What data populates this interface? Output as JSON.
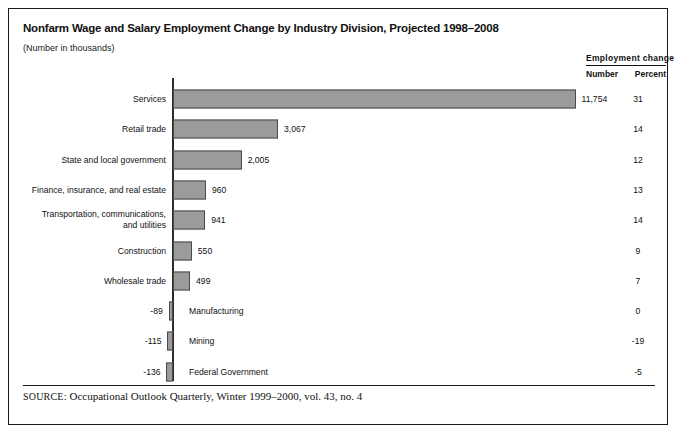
{
  "figure": {
    "title": "Nonfarm Wage and Salary Employment Change by Industry Division, Projected 1998–2008",
    "subtitle": "(Number in thousands)",
    "source_prefix": "SOURCE",
    "source_text": ": Occupational Outlook Quarterly, Winter 1999–2000, vol. 43, no. 4"
  },
  "columns": {
    "group_header": "Employment  change",
    "number_header": "Number",
    "percent_header": "Percent"
  },
  "rows": [
    {
      "category": "Services",
      "number": "11,754",
      "value_label": "11,754",
      "percent": "31",
      "value": 11754
    },
    {
      "category": "Retail trade",
      "number": "3,067",
      "value_label": "3,067",
      "percent": "14",
      "value": 3067
    },
    {
      "category": "State and local government",
      "number": "2,005",
      "value_label": "2,005",
      "percent": "12",
      "value": 2005
    },
    {
      "category": "Finance, insurance, and real estate",
      "number": "960",
      "value_label": "960",
      "percent": "13",
      "value": 960
    },
    {
      "category": "Transportation, communications,\nand utilities",
      "number": "941",
      "value_label": "941",
      "percent": "14",
      "value": 941
    },
    {
      "category": "Construction",
      "number": "550",
      "value_label": "550",
      "percent": "9",
      "value": 550
    },
    {
      "category": "Wholesale trade",
      "number": "499",
      "value_label": "499",
      "percent": "7",
      "value": 499
    },
    {
      "category": "Manufacturing",
      "number": "-89",
      "value_label": "-89",
      "percent": "0",
      "value": -89
    },
    {
      "category": "Mining",
      "number": "-115",
      "value_label": "-115",
      "percent": "-19",
      "value": -115
    },
    {
      "category": "Federal Government",
      "number": "-136",
      "value_label": "-136",
      "percent": "-5",
      "value": -136
    }
  ],
  "chart_data": {
    "type": "bar",
    "orientation": "horizontal",
    "title": "Nonfarm Wage and Salary Employment Change by Industry Division, Projected 1998–2008",
    "subtitle": "(Number in thousands)",
    "xlabel": "",
    "ylabel": "",
    "categories": [
      "Services",
      "Retail trade",
      "State and local government",
      "Finance, insurance, and real estate",
      "Transportation, communications, and utilities",
      "Construction",
      "Wholesale trade",
      "Manufacturing",
      "Mining",
      "Federal Government"
    ],
    "series": [
      {
        "name": "Employment change, number (thousands)",
        "values": [
          11754,
          3067,
          2005,
          960,
          941,
          550,
          499,
          -89,
          -115,
          -136
        ]
      },
      {
        "name": "Employment change, percent",
        "values": [
          31,
          14,
          12,
          13,
          14,
          9,
          7,
          0,
          -19,
          -5
        ]
      }
    ],
    "xlim": [
      -500,
      12000
    ],
    "grid": false,
    "legend": false,
    "bar_color": "#9b9b9b",
    "bar_edge_color": "#4a4a4a",
    "axis_color": "#2b2b2b",
    "source": "SOURCE: Occupational Outlook Quarterly, Winter 1999–2000, vol. 43, no. 4"
  }
}
